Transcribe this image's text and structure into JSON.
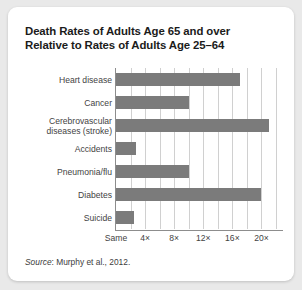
{
  "card": {
    "title_line1": "Death Rates of Adults Age 65 and over",
    "title_line2": "Relative to Rates of Adults Age 25–64",
    "source_prefix": "Source",
    "source_text": ": Murphy et al., 2012."
  },
  "colors": {
    "background": "#e9e9e9",
    "card": "#ffffff",
    "bar": "#7b7b7b",
    "gridline": "#d0d0d0",
    "axis": "#8d8d8d",
    "title_text": "#1b1b1b",
    "label_text": "#434343"
  },
  "chart_data": {
    "type": "bar",
    "orientation": "horizontal",
    "title": "Death Rates of Adults Age 65 and over Relative to Rates of Adults Age 25–64",
    "xlabel": "",
    "ylabel": "",
    "categories": [
      "Heart disease",
      "Cancer",
      "Cerebrovascular diseases (stroke)",
      "Accidents",
      "Pneumonia/flu",
      "Diabetes",
      "Suicide"
    ],
    "category_lines": [
      [
        "Heart disease"
      ],
      [
        "Cancer"
      ],
      [
        "Cerebrovascular",
        "diseases (stroke)"
      ],
      [
        "Accidents"
      ],
      [
        "Pneumonia/flu"
      ],
      [
        "Diabetes"
      ],
      [
        "Suicide"
      ]
    ],
    "values": [
      17,
      10,
      21,
      2.8,
      10,
      20,
      2.5
    ],
    "xlim": [
      0,
      22
    ],
    "tick_values": [
      0,
      4,
      8,
      12,
      16,
      20
    ],
    "tick_labels": [
      "Same",
      "4×",
      "8×",
      "12×",
      "16×",
      "20×"
    ],
    "gridline_values": [
      2,
      4,
      6,
      8,
      10,
      12,
      14,
      16,
      18,
      20,
      22
    ],
    "grid": true,
    "legend": false,
    "series": [
      {
        "name": "Relative death rate (65+ vs 25–64)",
        "values": [
          17,
          10,
          21,
          2.8,
          10,
          20,
          2.5
        ]
      }
    ],
    "source": "Source: Murphy et al., 2012."
  }
}
